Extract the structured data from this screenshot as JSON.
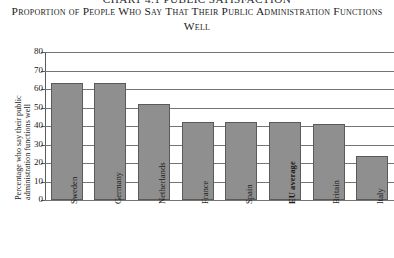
{
  "top_partial_heading": "CHART 4.1 PUBLIC SATISFACTION",
  "title": "Proportion of People Who Say That Their Public Administration Functions Well",
  "chart_data": {
    "type": "bar",
    "title": "Proportion of People Who Say That Their Public Administration Functions Well",
    "xlabel": "",
    "ylabel": "Percentage who say their public administration functions well",
    "categories": [
      "Sweden",
      "Germany",
      "Netherlands",
      "France",
      "Spain",
      "EU average",
      "Britain",
      "Italy"
    ],
    "values": [
      63,
      63,
      52,
      42,
      42,
      42,
      41,
      24
    ],
    "highlighted_category": "EU average",
    "ylim": [
      0,
      80
    ],
    "yticks": [
      0,
      10,
      20,
      30,
      40,
      50,
      60,
      70,
      80
    ],
    "ytick_labels": [
      "0",
      "10",
      "20",
      "30",
      "40",
      "50",
      "60",
      "70",
      "80"
    ],
    "grid": true,
    "legend": "none",
    "bar_color": "#8f8f8f",
    "bar_edge_color": "#5a5a5a"
  }
}
